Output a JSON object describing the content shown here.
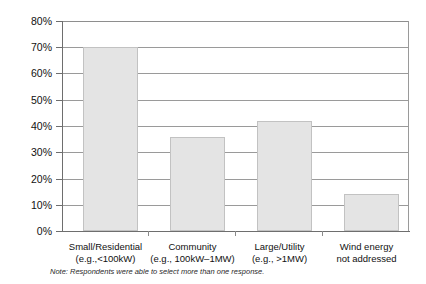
{
  "chart_data": {
    "type": "bar",
    "title": "",
    "subtitle": "",
    "xlabel": "",
    "ylabel": "",
    "categories": [
      "Small/Residential",
      "Community",
      "Large/Utility",
      "Wind energy"
    ],
    "category_sublabels": [
      "(e.g.,<100kW)",
      "(e.g., 100kW–1MW)",
      "(e.g., >1MW)",
      "not addressed"
    ],
    "values": [
      70,
      36,
      42,
      14
    ],
    "value_labels": [
      "70%",
      "36%",
      "42%",
      "14%"
    ],
    "ylim": [
      0,
      80
    ],
    "ytick_values": [
      0,
      10,
      20,
      30,
      40,
      50,
      60,
      70,
      80
    ],
    "ytick_labels": [
      "0%",
      "10%",
      "20%",
      "30%",
      "40%",
      "50%",
      "60%",
      "70%",
      "80%"
    ],
    "grid": true,
    "legend": "none",
    "bar_color": "#e4e4e4",
    "bar_border_color": "#c2c2c2",
    "gridline_color": "#9a9a9a",
    "axis_color": "#6e6e6e"
  },
  "footnote": {
    "note_label": "Note:",
    "note_text": " Respondents were able to select more than one response."
  }
}
